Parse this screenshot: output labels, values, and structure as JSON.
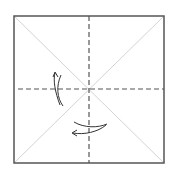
{
  "diagram": {
    "type": "origami-fold-diagram",
    "square": {
      "x": 14,
      "y": 16,
      "size": 150,
      "stroke": "#555555"
    },
    "diagonals": {
      "color": "#d4d4d4"
    },
    "valley_folds": {
      "color": "#555555",
      "dash": "5,3"
    },
    "arrows": [
      {
        "name": "left-fold-arrow",
        "direction": "up",
        "color": "#333333"
      },
      {
        "name": "bottom-fold-arrow",
        "direction": "left",
        "color": "#333333"
      }
    ]
  }
}
